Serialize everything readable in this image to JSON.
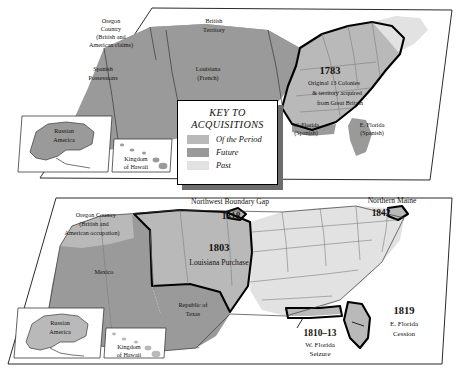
{
  "legend": {
    "title_line1": "KEY TO",
    "title_line2": "ACQUISITIONS",
    "entries": [
      {
        "label": "Of the Period",
        "color": "#b9b9b9",
        "swatch_name": "of-the-period"
      },
      {
        "label": "Future",
        "color": "#9a9a9a",
        "swatch_name": "future"
      },
      {
        "label": "Past",
        "color": "#e2e2e2",
        "swatch_name": "past"
      }
    ]
  },
  "top_map": {
    "labels": {
      "oregon_l1": "Oregon",
      "oregon_l2": "Country",
      "oregon_l3": "(British and",
      "oregon_l4": "American claims)",
      "british_l1": "British",
      "british_l2": "Territory",
      "spanish_l1": "Spanish",
      "spanish_l2": "Possessions",
      "louisiana_l1": "Louisiana",
      "louisiana_l2": "(French)",
      "year": "1783",
      "colonies_l1": "Original 13 Colonies",
      "colonies_l2": "& territory acquired",
      "colonies_l3": "from Great Britain",
      "wflorida_l1": "W. Florida",
      "wflorida_l2": "(Spanish)",
      "eflorida_l1": "E. Florida",
      "eflorida_l2": "(Spanish)",
      "russian_l1": "Russian",
      "russian_l2": "America",
      "hawaii_l1": "Kingdom",
      "hawaii_l2": "of Hawaii"
    }
  },
  "bottom_map": {
    "labels": {
      "oregon_l1": "Oregon Country",
      "oregon_l2": "(British and",
      "oregon_l3": "American occupation)",
      "nw_gap": "Northwest Boundary Gap",
      "nw_year": "1818",
      "maine": "Northern Maine",
      "maine_year": "1842",
      "lp_year": "1803",
      "lp_name": "Louisiana Purchase",
      "mexico": "Mexico",
      "texas_l1": "Republic of",
      "texas_l2": "Texas",
      "wfl_year": "1810–13",
      "wfl_l1": "W. Florida",
      "wfl_l2": "Seizure",
      "efl_year": "1819",
      "efl_l1": "E. Florida",
      "efl_l2": "Cession",
      "russian_l1": "Russian",
      "russian_l2": "America",
      "hawaii_l1": "Kingdom",
      "hawaii_l2": "of Hawaii"
    }
  }
}
